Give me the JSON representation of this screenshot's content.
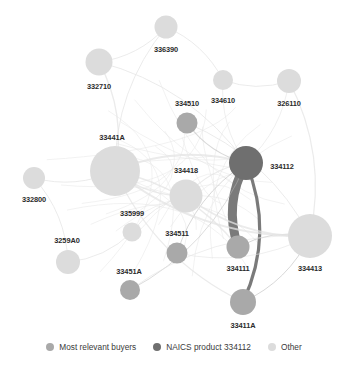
{
  "figure": {
    "type": "network-graph",
    "width": 348,
    "height": 366
  },
  "colors": {
    "most_relevant_buyers": "#a9a9a9",
    "naics_product_334112": "#6f6f6f",
    "other": "#dcdcdc",
    "edge_light": "#e4e4e4",
    "edge_mid": "#b8b8b8",
    "edge_dark": "#6f6f6f",
    "label_text": "#2b2b2b",
    "legend_text": "#3a3a3a",
    "background": "#ffffff"
  },
  "chart_data": {
    "type": "network",
    "title": "",
    "nodes": [
      {
        "id": "336390",
        "label": "336390",
        "x": 166,
        "y": 27,
        "r": 11.5,
        "group": "other",
        "label_dx": 0,
        "label_dy": 22
      },
      {
        "id": "332710",
        "label": "332710",
        "x": 99,
        "y": 62,
        "r": 13.5,
        "group": "other",
        "label_dx": 0,
        "label_dy": 24
      },
      {
        "id": "334610",
        "label": "334610",
        "x": 223,
        "y": 80,
        "r": 10,
        "group": "other",
        "label_dx": 0,
        "label_dy": 20
      },
      {
        "id": "326110",
        "label": "326110",
        "x": 289,
        "y": 81,
        "r": 12,
        "group": "other",
        "label_dx": 0,
        "label_dy": 22
      },
      {
        "id": "334510",
        "label": "334510",
        "x": 187,
        "y": 123,
        "r": 10.5,
        "group": "buyer",
        "label_dx": 0,
        "label_dy": -20
      },
      {
        "id": "33441A",
        "label": "33441A",
        "x": 115,
        "y": 171,
        "r": 25,
        "group": "other",
        "label_dx": -3,
        "label_dy": -34
      },
      {
        "id": "334112",
        "label": "334112",
        "x": 246,
        "y": 163,
        "r": 17,
        "group": "naics",
        "label_dx": 36,
        "label_dy": 3
      },
      {
        "id": "334418",
        "label": "334418",
        "x": 186,
        "y": 196,
        "r": 16.5,
        "group": "other",
        "label_dx": 0,
        "label_dy": -26
      },
      {
        "id": "332800",
        "label": "332800",
        "x": 34,
        "y": 178,
        "r": 11,
        "group": "other",
        "label_dx": 0,
        "label_dy": 21
      },
      {
        "id": "335999",
        "label": "335999",
        "x": 132,
        "y": 232,
        "r": 9.5,
        "group": "other",
        "label_dx": 0,
        "label_dy": -19
      },
      {
        "id": "3259A0",
        "label": "3259A0",
        "x": 68,
        "y": 262,
        "r": 12,
        "group": "other",
        "label_dx": -1,
        "label_dy": -22
      },
      {
        "id": "334511",
        "label": "334511",
        "x": 177,
        "y": 253,
        "r": 10.5,
        "group": "buyer",
        "label_dx": 0,
        "label_dy": -20
      },
      {
        "id": "33451A",
        "label": "33451A",
        "x": 130,
        "y": 290,
        "r": 10,
        "group": "buyer",
        "label_dx": -1,
        "label_dy": -19
      },
      {
        "id": "334111",
        "label": "334111",
        "x": 238,
        "y": 247,
        "r": 11.5,
        "group": "buyer",
        "label_dx": 0,
        "label_dy": 21
      },
      {
        "id": "33411A",
        "label": "33411A",
        "x": 243,
        "y": 302,
        "r": 13,
        "group": "buyer",
        "label_dx": 0,
        "label_dy": 23
      },
      {
        "id": "334413",
        "label": "334413",
        "x": 310,
        "y": 236,
        "r": 22,
        "group": "other",
        "label_dx": 0,
        "label_dy": 32
      }
    ],
    "edges": [
      {
        "source": "334112",
        "target": "334111",
        "weight": 9,
        "style": "dark"
      },
      {
        "source": "334112",
        "target": "33411A",
        "weight": 3.2,
        "style": "dark"
      },
      {
        "source": "334510",
        "target": "334112",
        "weight": 1.2,
        "style": "mid"
      },
      {
        "source": "334511",
        "target": "334112",
        "weight": 1.0,
        "style": "mid"
      },
      {
        "source": "33451A",
        "target": "334112",
        "weight": 0.9,
        "style": "mid"
      },
      {
        "source": "334111",
        "target": "334413",
        "weight": 1.0,
        "style": "mid"
      },
      {
        "source": "33411A",
        "target": "334413",
        "weight": 1.0,
        "style": "mid"
      },
      {
        "source": "33441A",
        "target": "334112",
        "weight": 2.0,
        "style": "light"
      },
      {
        "source": "33441A",
        "target": "334413",
        "weight": 2.0,
        "style": "light"
      },
      {
        "source": "332710",
        "target": "33441A",
        "weight": 1.4,
        "style": "light"
      },
      {
        "source": "332710",
        "target": "336390",
        "weight": 1.0,
        "style": "light"
      },
      {
        "source": "336390",
        "target": "334610",
        "weight": 1.0,
        "style": "light"
      },
      {
        "source": "334610",
        "target": "326110",
        "weight": 1.0,
        "style": "light"
      },
      {
        "source": "326110",
        "target": "334413",
        "weight": 1.2,
        "style": "light"
      },
      {
        "source": "332800",
        "target": "33441A",
        "weight": 1.0,
        "style": "light"
      },
      {
        "source": "332800",
        "target": "3259A0",
        "weight": 1.0,
        "style": "light"
      },
      {
        "source": "3259A0",
        "target": "335999",
        "weight": 1.0,
        "style": "light"
      },
      {
        "source": "335999",
        "target": "334418",
        "weight": 1.0,
        "style": "light"
      },
      {
        "source": "334418",
        "target": "334413",
        "weight": 1.6,
        "style": "light"
      },
      {
        "source": "334418",
        "target": "334112",
        "weight": 1.2,
        "style": "light"
      },
      {
        "source": "33441A",
        "target": "334418",
        "weight": 1.6,
        "style": "light"
      },
      {
        "source": "33441A",
        "target": "334111",
        "weight": 1.4,
        "style": "light"
      },
      {
        "source": "33441A",
        "target": "33411A",
        "weight": 1.2,
        "style": "light"
      },
      {
        "source": "332710",
        "target": "334112",
        "weight": 1.0,
        "style": "light"
      },
      {
        "source": "336390",
        "target": "33441A",
        "weight": 1.0,
        "style": "light"
      },
      {
        "source": "33451A",
        "target": "334413",
        "weight": 0.8,
        "style": "light"
      },
      {
        "source": "334511",
        "target": "334413",
        "weight": 0.8,
        "style": "light"
      },
      {
        "source": "334510",
        "target": "334413",
        "weight": 1.0,
        "style": "light"
      },
      {
        "source": "334610",
        "target": "334112",
        "weight": 0.8,
        "style": "light"
      },
      {
        "source": "326110",
        "target": "334112",
        "weight": 0.8,
        "style": "light"
      }
    ]
  },
  "legend": {
    "items": [
      {
        "label": "Most relevant buyers",
        "color": "#a9a9a9"
      },
      {
        "label": "NAICS product 334112",
        "color": "#6f6f6f"
      },
      {
        "label": "Other",
        "color": "#dcdcdc"
      }
    ]
  }
}
